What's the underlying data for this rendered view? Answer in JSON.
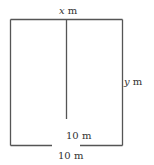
{
  "diagram": {
    "labels": {
      "top": {
        "var": "x",
        "unit": " m"
      },
      "right": {
        "var": "y",
        "unit": " m"
      },
      "divider_gap": "10 m",
      "bottom_gap": "10 m"
    },
    "colors": {
      "line": "#555555",
      "text": "#333333"
    }
  }
}
